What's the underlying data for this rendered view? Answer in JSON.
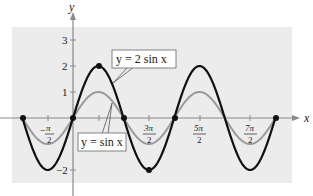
{
  "chart_data": {
    "type": "line",
    "title": "",
    "xlabel": "x",
    "ylabel": "y",
    "xlim": [
      -3.1416,
      12.566
    ],
    "ylim": [
      -2.5,
      3.5
    ],
    "grid": false,
    "x_tick_labels": [
      "-π/2",
      "3π/2",
      "5π/2",
      "7π/2"
    ],
    "x_tick_values": [
      -1.5708,
      4.7124,
      7.854,
      10.9956
    ],
    "x_minor_ticks": [
      1.5708,
      3.1416,
      6.2832,
      9.4248
    ],
    "y_tick_labels": [
      "3",
      "2",
      "1",
      "-2"
    ],
    "y_tick_values": [
      3,
      2,
      1,
      -2
    ],
    "series": [
      {
        "name": "y = 2 sin x",
        "function": "2*sin(x)",
        "color": "#111111",
        "width": 2.2,
        "marked_points": [
          [
            -3.1416,
            0
          ],
          [
            0,
            0
          ],
          [
            1.5708,
            2
          ],
          [
            3.1416,
            0
          ],
          [
            4.7124,
            -2
          ],
          [
            6.2832,
            0
          ],
          [
            12.566,
            0
          ]
        ]
      },
      {
        "name": "y = sin x",
        "function": "sin(x)",
        "color": "#9a9a9a",
        "width": 2
      }
    ],
    "annotations": [
      {
        "text": "y = 2 sin x",
        "points_to": "y = 2 sin x"
      },
      {
        "text": "y = sin x",
        "points_to": "y = sin x"
      }
    ]
  },
  "labels": {
    "y_axis": "y",
    "x_axis": "x",
    "tick_3": "3",
    "tick_2": "2",
    "tick_1": "1",
    "tick_neg2": "−2",
    "neg_pi_half_num": "π",
    "neg_pi_half_den": "2",
    "three_pi_half_num": "3π",
    "three_pi_half_den": "2",
    "five_pi_half_num": "5π",
    "five_pi_half_den": "2",
    "seven_pi_half_num": "7π",
    "seven_pi_half_den": "2",
    "legend_2sin": "y = 2 sin x",
    "legend_sin": "y = sin x"
  },
  "colors": {
    "background_panel": "#ececec",
    "axis": "#8a8a8a",
    "curve_2sin": "#111111",
    "curve_sin": "#9a9a9a"
  }
}
